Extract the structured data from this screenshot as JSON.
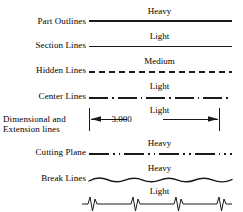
{
  "diagram": {
    "stroke_color": "#1a1a1a",
    "background": "#ffffff",
    "rows": [
      {
        "id": "part-outlines",
        "label": "Part Outlines",
        "weight_caption": "Heavy",
        "line_style": "continuous",
        "stroke_width": 2.0
      },
      {
        "id": "section-lines",
        "label": "Section Lines",
        "weight_caption": "Light",
        "line_style": "continuous",
        "stroke_width": 1.0
      },
      {
        "id": "hidden-lines",
        "label": "Hidden Lines",
        "weight_caption": "Medium",
        "line_style": "dashed",
        "stroke_width": 1.3,
        "dash_pattern": "6,4"
      },
      {
        "id": "center-lines",
        "label": "Center Lines",
        "weight_caption": "Light",
        "line_style": "dash-dot",
        "stroke_width": 1.0,
        "dash_pattern": "19,4,1.6,4"
      },
      {
        "id": "dimensional-extension-lines",
        "label": "Dimensional and Extension lines",
        "label_line_1": "Dimensional and",
        "label_line_2": "Extension lines",
        "weight_caption": "Light",
        "line_style": "dimension-with-arrows",
        "stroke_width": 1.0,
        "dimension_value": "3.000"
      },
      {
        "id": "cutting-plane",
        "label": "Cutting Plane",
        "weight_caption": "Heavy",
        "line_style": "dash-double-dot",
        "stroke_width": 1.8,
        "dash_pattern": "20,4,1.6,4,1.6,4"
      },
      {
        "id": "break-lines-wavy",
        "label": "Break Lines",
        "weight_caption": "Heavy",
        "line_style": "freehand-wavy",
        "stroke_width": 1.4
      },
      {
        "id": "break-lines-zigzag",
        "label": "",
        "weight_caption": "Light",
        "line_style": "long-break-zigzag",
        "stroke_width": 1.0,
        "zigzag_count": 4
      }
    ]
  }
}
